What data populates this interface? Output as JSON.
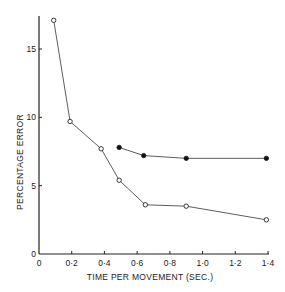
{
  "chart_data": {
    "type": "line",
    "title": "",
    "xlabel": "TIME PER MOVEMENT (SEC.)",
    "ylabel": "PERCENTAGE ERROR",
    "xlim": [
      0,
      1.4
    ],
    "ylim": [
      0,
      17.5
    ],
    "xticks": [
      0,
      0.2,
      0.4,
      0.6,
      0.8,
      1.0,
      1.2,
      1.4
    ],
    "xtick_labels": [
      "0",
      "0·2",
      "0·4",
      "0·6",
      "0·8",
      "1·0",
      "1·2",
      "1·4"
    ],
    "yticks": [
      0,
      5,
      10,
      15
    ],
    "ytick_labels": [
      "0",
      "5",
      "10",
      "15"
    ],
    "grid": false,
    "legend": null,
    "series": [
      {
        "name": "open circles",
        "marker": "open-circle",
        "x": [
          0.09,
          0.19,
          0.38,
          0.49,
          0.65,
          0.9,
          1.39
        ],
        "y": [
          17.1,
          9.7,
          7.7,
          5.4,
          3.6,
          3.5,
          2.5
        ]
      },
      {
        "name": "filled circles",
        "marker": "filled-circle",
        "x": [
          0.49,
          0.64,
          0.9,
          1.39
        ],
        "y": [
          7.8,
          7.2,
          7.0,
          7.0
        ]
      }
    ]
  }
}
